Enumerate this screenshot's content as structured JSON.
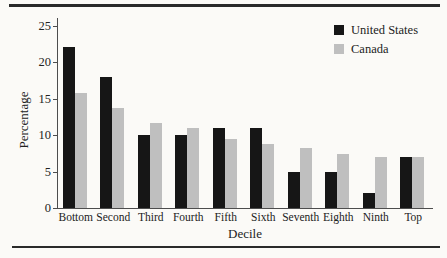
{
  "figure": {
    "background_color": "#fbfaf7",
    "rule_color": "#2a2a2a",
    "axis_color": "#4d4d4d",
    "text_color": "#222222"
  },
  "chart_data": {
    "type": "bar",
    "title": "",
    "xlabel": "Decile",
    "ylabel": "Percentage",
    "categories": [
      "Bottom",
      "Second",
      "Third",
      "Fourth",
      "Fifth",
      "Sixth",
      "Seventh",
      "Eighth",
      "Ninth",
      "Top"
    ],
    "series": [
      {
        "name": "United States",
        "color": "#161616",
        "values": [
          22,
          18,
          10,
          10,
          11,
          11,
          5,
          5,
          2,
          7
        ]
      },
      {
        "name": "Canada",
        "color": "#bfbfbf",
        "values": [
          15.7,
          13.7,
          11.6,
          10.9,
          9.5,
          8.7,
          8.2,
          7.4,
          7,
          7
        ]
      }
    ],
    "ylim": [
      0,
      25
    ],
    "yticks": [
      0,
      5,
      10,
      15,
      20,
      25
    ],
    "legend_position": "top-right",
    "grid": false
  },
  "legend": {
    "items": [
      {
        "label": "United States",
        "color": "#161616"
      },
      {
        "label": "Canada",
        "color": "#bfbfbf"
      }
    ]
  }
}
